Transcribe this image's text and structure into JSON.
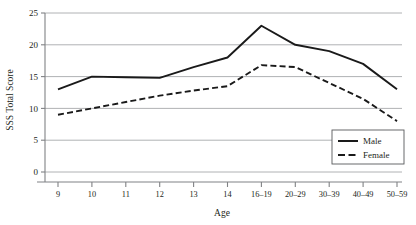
{
  "chart_data": {
    "type": "line",
    "title": "",
    "xlabel": "Age",
    "ylabel": "SSS Total Score",
    "categories": [
      "9",
      "10",
      "11",
      "12",
      "13",
      "14",
      "16–19",
      "20–29",
      "30–39",
      "40–49",
      "50–59"
    ],
    "ylim": [
      0,
      25
    ],
    "yticks": [
      0,
      5,
      10,
      15,
      20,
      25
    ],
    "ytick_labels": [
      "0",
      "5",
      "10",
      "15",
      "20",
      "25"
    ],
    "grid": "horizontal",
    "legend_position": "bottom-right",
    "series": [
      {
        "name": "Male",
        "style": "solid",
        "color": "#1a1a1a",
        "values": [
          13.0,
          15.0,
          14.9,
          14.8,
          16.5,
          18.0,
          23.0,
          20.0,
          19.0,
          17.0,
          13.0
        ]
      },
      {
        "name": "Female",
        "style": "dashed",
        "color": "#1a1a1a",
        "values": [
          9.0,
          10.0,
          11.0,
          12.0,
          12.8,
          13.5,
          16.8,
          16.5,
          14.0,
          11.5,
          8.0
        ]
      }
    ],
    "colors": {
      "grid": "#a7a9ac",
      "axis": "#808285",
      "ink": "#231f20",
      "background": "#ffffff"
    }
  },
  "legend": {
    "items": [
      {
        "label": "Male"
      },
      {
        "label": "Female"
      }
    ]
  }
}
